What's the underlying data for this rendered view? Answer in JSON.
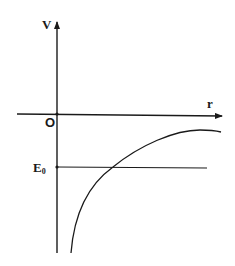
{
  "diagram": {
    "type": "potential-energy-curve",
    "axes": {
      "y_label": "V",
      "x_label": "r",
      "origin_label": "O"
    },
    "energy_level": {
      "label_main": "E",
      "label_sub": "0"
    },
    "colors": {
      "line": "#1a1a1a",
      "background": "#ffffff"
    }
  }
}
